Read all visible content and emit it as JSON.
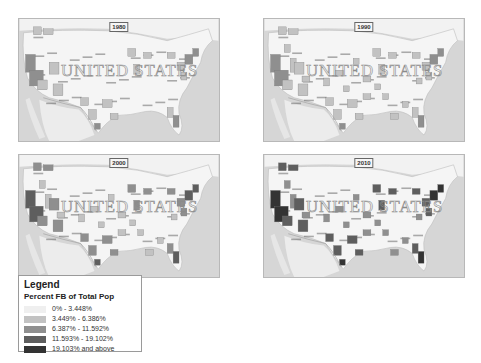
{
  "panels": [
    {
      "year": "1980",
      "watermark": "UNITED STATES",
      "intensity": 1
    },
    {
      "year": "1990",
      "watermark": "UNITED STATES",
      "intensity": 2
    },
    {
      "year": "2000",
      "watermark": "UNITED STATES",
      "intensity": 3
    },
    {
      "year": "2010",
      "watermark": "UNITED STATES",
      "intensity": 4
    }
  ],
  "legend": {
    "title": "Legend",
    "subtitle": "Percent FB of Total Pop",
    "classes": [
      {
        "label": "0% - 3.448%",
        "color": "#efefef"
      },
      {
        "label": "3.449% - 6.386%",
        "color": "#c2c2c2"
      },
      {
        "label": "6.387% - 11.592%",
        "color": "#8f8f8f"
      },
      {
        "label": "11.593% - 19.102%",
        "color": "#5e5e5e"
      },
      {
        "label": "19.103% and above",
        "color": "#333333"
      }
    ]
  },
  "colors": {
    "water": "#d6d6d6",
    "land": "#f5f5f5",
    "mexico": "#ececec",
    "border": "#b8b8b8"
  }
}
